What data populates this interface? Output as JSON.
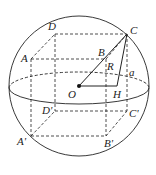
{
  "diagram": {
    "colors": {
      "stroke": "#222222",
      "background": "#ffffff"
    },
    "sphere": {
      "cx": 79,
      "cy": 86,
      "r": 70
    },
    "equator": {
      "cx": 79,
      "cy": 88,
      "rx": 70,
      "ry": 16
    },
    "points": {
      "A": {
        "label": "A",
        "x": 31,
        "y": 59
      },
      "B": {
        "label": "B",
        "x": 106,
        "y": 59
      },
      "C": {
        "label": "C",
        "x": 127,
        "y": 34
      },
      "D": {
        "label": "D",
        "x": 55,
        "y": 34
      },
      "A1": {
        "label": "A'",
        "x": 31,
        "y": 136
      },
      "B1": {
        "label": "B'",
        "x": 106,
        "y": 136
      },
      "C1": {
        "label": "C'",
        "x": 127,
        "y": 111
      },
      "D1": {
        "label": "D'",
        "x": 55,
        "y": 111
      },
      "O": {
        "label": "O",
        "x": 79,
        "y": 86
      },
      "H": {
        "label": "H",
        "x": 117,
        "y": 86
      }
    },
    "segment_labels": {
      "R": "R",
      "a": "a"
    }
  }
}
